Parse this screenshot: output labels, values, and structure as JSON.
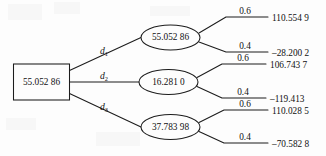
{
  "diagram": {
    "type": "decision-tree",
    "root": {
      "label": "55.052 86",
      "shape": "rectangle"
    },
    "branches": [
      {
        "label": "d",
        "subscript": "1",
        "node": {
          "label": "55.052 86",
          "shape": "ellipse"
        },
        "outcomes": [
          {
            "probability": "0.6",
            "value": "110.554 9"
          },
          {
            "probability": "0.4",
            "value": "–28.200 2"
          }
        ]
      },
      {
        "label": "d",
        "subscript": "2",
        "node": {
          "label": "16.281 0",
          "shape": "ellipse"
        },
        "outcomes": [
          {
            "probability": "0.6",
            "value": "106.743 7"
          },
          {
            "probability": "0.4",
            "value": "–119.413"
          }
        ]
      },
      {
        "label": "d",
        "subscript": "3",
        "node": {
          "label": "37.783 98",
          "shape": "ellipse"
        },
        "outcomes": [
          {
            "probability": "0.6",
            "value": "110.028 5"
          },
          {
            "probability": "0.4",
            "value": "–70.582 8"
          }
        ]
      }
    ],
    "colors": {
      "stroke": "#1c1c1c",
      "background": "#fdfdfd",
      "text": "#101010"
    }
  }
}
